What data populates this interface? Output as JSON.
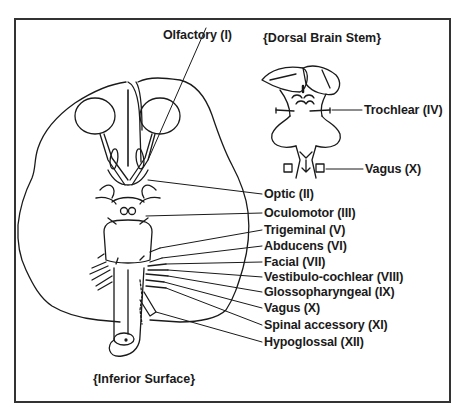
{
  "diagram": {
    "titles": {
      "dorsal": "{Dorsal Brain Stem}",
      "inferior": "{Inferior Surface}"
    },
    "labels": [
      {
        "id": "olfactory",
        "text": "Olfactory (I)"
      },
      {
        "id": "optic",
        "text": "Optic (II)"
      },
      {
        "id": "oculomotor",
        "text": "Oculomotor (III)"
      },
      {
        "id": "trochlear",
        "text": "Trochlear (IV)"
      },
      {
        "id": "trigeminal",
        "text": "Trigeminal (V)"
      },
      {
        "id": "abducens",
        "text": "Abducens (VI)"
      },
      {
        "id": "facial",
        "text": "Facial (VII)"
      },
      {
        "id": "vestibulocochlear",
        "text": "Vestibulo-cochlear (VIII)"
      },
      {
        "id": "glossopharyngeal",
        "text": "Glossopharyngeal (IX)"
      },
      {
        "id": "vagus",
        "text": "Vagus (X)"
      },
      {
        "id": "spinal-accessory",
        "text": "Spinal accessory (XI)"
      },
      {
        "id": "hypoglossal",
        "text": "Hypoglossal (XII)"
      },
      {
        "id": "vagus-dorsal",
        "text": "Vagus (X)"
      }
    ],
    "colors": {
      "line": "#1a1a1a",
      "frame": "#333333",
      "background": "#ffffff"
    }
  }
}
